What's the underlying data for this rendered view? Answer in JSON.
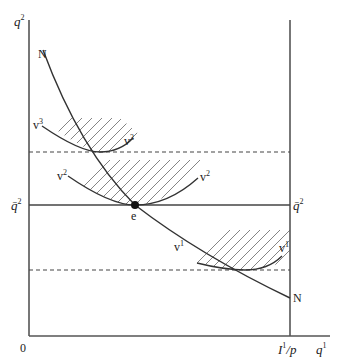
{
  "diagram": {
    "axes": {
      "y_label": "q",
      "y_label_sup": "2",
      "x_label": "q",
      "x_label_sup": "1",
      "origin_label": "0",
      "x_intercept_label": "I",
      "x_intercept_sup": "1",
      "x_intercept_suffix": "/p"
    },
    "reference_line": {
      "label_left": "q̄",
      "label_left_sup": "2",
      "label_right": "q̄",
      "label_right_sup": "2"
    },
    "curve_N": {
      "label_top": "N",
      "label_bottom": "N"
    },
    "indifference_curves": [
      {
        "label_left": "v",
        "label_left_sup": "3",
        "label_right": "v",
        "label_right_sup": "3"
      },
      {
        "label_left": "v",
        "label_left_sup": "2",
        "label_right": "v",
        "label_right_sup": "2"
      },
      {
        "label_left": "v",
        "label_left_sup": "1",
        "label_right": "v",
        "label_right_sup": "1"
      }
    ],
    "equilibrium": {
      "label": "e"
    }
  }
}
